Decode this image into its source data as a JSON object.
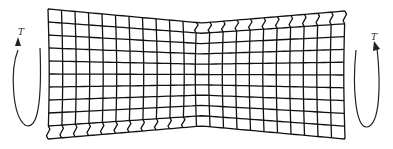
{
  "figure": {
    "grid": {
      "columns": 22,
      "rows": 10,
      "stroke_color": "#111111",
      "left_end": {
        "x": 48,
        "top": 9,
        "bottom": 139
      },
      "waist": {
        "x": 202,
        "top": 23,
        "bottom": 126
      },
      "right_end": {
        "x": 345,
        "top": 11,
        "bottom": 139
      },
      "wavy_row": "bottom row on left half, top row on right half"
    },
    "torque_left": {
      "label": "T",
      "direction": "up-arrow on left side of loop"
    },
    "torque_right": {
      "label": "T",
      "direction": "up-arrow on right side of loop"
    }
  }
}
